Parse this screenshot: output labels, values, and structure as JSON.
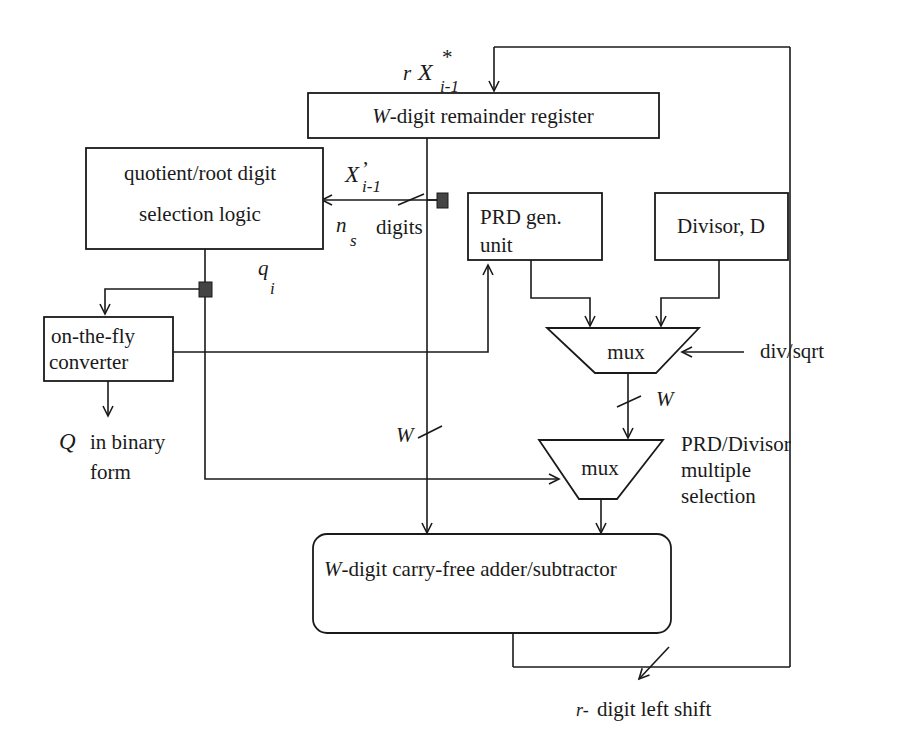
{
  "diagram": {
    "title": "",
    "blocks": {
      "remainder_register": {
        "label": "-digit remainder register",
        "prefix": "W"
      },
      "qds_logic": {
        "line1": "quotient/root digit",
        "line2": "selection  logic"
      },
      "prd_gen": {
        "line1": "PRD gen.",
        "line2": "unit"
      },
      "divisor": {
        "label": "Divisor, D"
      },
      "otf_converter": {
        "line1": "on-the-fly",
        "line2": "converter"
      },
      "mux_top": {
        "label": "mux"
      },
      "mux_bottom": {
        "label": "mux"
      },
      "adder": {
        "label": "-digit carry-free adder/subtractor",
        "prefix": "W"
      }
    },
    "annotations": {
      "rx_input": {
        "r": "r",
        "X": "X",
        "sup": "*",
        "sub": "i-1"
      },
      "x_prime": {
        "X": "X",
        "prime": "’",
        "sub": "i-1"
      },
      "ns_digits": {
        "n": "n",
        "sub": "s",
        "text": "digits"
      },
      "q_i": {
        "q": "q",
        "sub": "i"
      },
      "q_output": {
        "Q": "Q",
        "line1": "in binary",
        "line2": "form"
      },
      "div_sqrt": "div/sqrt",
      "w_width_mux": "W",
      "w_width_reg": "W",
      "mux_bottom_desc": {
        "line1": "PRD/Divisor",
        "line2": "multiple",
        "line3": "selection"
      },
      "shift": {
        "r": "r-",
        "text": "digit left shift"
      }
    },
    "colors": {
      "ink": "#1a1a1a",
      "background": "#ffffff",
      "junction": "#444444"
    }
  }
}
